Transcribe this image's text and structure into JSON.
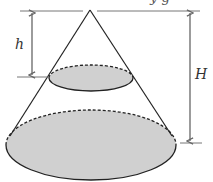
{
  "diagram": {
    "title_fragment": "y         g",
    "labels": {
      "small_height": "h",
      "large_height": "H"
    },
    "colors": {
      "fill": "#d0d0d0",
      "stroke": "#222222",
      "dimension": "#666666"
    },
    "shapes": {
      "apex": [
        90,
        10
      ],
      "small_base": {
        "cx": 91,
        "cy": 78,
        "rx": 42,
        "ry": 13,
        "top_dashed": true
      },
      "large_base": {
        "cx": 91,
        "cy": 145,
        "rx": 85,
        "ry": 35,
        "top_dashed": true
      }
    },
    "dimensions": [
      {
        "name": "h",
        "x": 32,
        "y_top": 11,
        "y_bottom": 77
      },
      {
        "name": "H",
        "x": 190,
        "y_top": 11,
        "y_bottom": 143
      }
    ]
  }
}
